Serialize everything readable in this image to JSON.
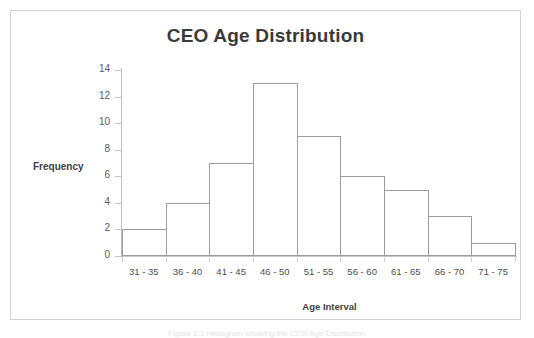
{
  "figure": {
    "caption": "Figure 2.1 Histogram showing the CEO Age Distribution"
  },
  "chart_data": {
    "type": "bar",
    "title": "CEO Age Distribution",
    "xlabel": "Age Interval",
    "ylabel": "Frequency",
    "categories": [
      "31 - 35",
      "36 - 40",
      "41 - 45",
      "46 - 50",
      "51 - 55",
      "56 - 60",
      "61 - 65",
      "66 - 70",
      "71 - 75"
    ],
    "values": [
      2,
      4,
      7,
      13,
      9,
      6,
      5,
      3,
      1
    ],
    "ylim": [
      0,
      14
    ],
    "y_ticks": [
      0,
      2,
      4,
      6,
      8,
      10,
      12,
      14
    ],
    "y_tick_labels": [
      "0",
      "2",
      "4",
      "6",
      "8",
      "10",
      "12",
      "14"
    ],
    "grid": false,
    "legend": false,
    "bar_fill": "#ffffff",
    "bar_border": "#9c9c9c",
    "axis_color": "#bfbfbf",
    "text_color": "#3f3f3f",
    "frame_color": "#d2d2d2"
  }
}
